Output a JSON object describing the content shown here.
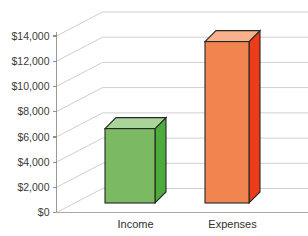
{
  "chart_data": {
    "type": "bar",
    "title": "",
    "xlabel": "",
    "ylabel": "",
    "categories": [
      "Income",
      "Expenses"
    ],
    "values": [
      5900,
      12800
    ],
    "ylim": [
      0,
      14000
    ],
    "ytick_values": [
      0,
      2000,
      4000,
      6000,
      8000,
      10000,
      12000,
      14000
    ],
    "ytick_labels": [
      "$0",
      "$2,000",
      "$4,000",
      "$6,000",
      "$8,000",
      "$10,000",
      "$12,000",
      "$14,000"
    ],
    "grid": true,
    "legend": "none",
    "style": "3d-column",
    "series": [
      {
        "name": "Amount",
        "values": [
          5900,
          12800
        ],
        "point_colors": [
          "#7cb963",
          "#f0854f"
        ]
      }
    ],
    "bar_colors": {
      "income_front": "#7cb963",
      "income_side": "#4cac3b",
      "income_top": "#a9d49a",
      "expenses_front": "#f0854f",
      "expenses_side": "#ee3b1a",
      "expenses_top": "#f8b18b"
    },
    "axis_colors": {
      "gridline": "#c9c9c9",
      "axis": "#9a9a9a",
      "tick_label": "#3a3a3a",
      "category_label": "#2f2f2f",
      "bar_outline": "#262626",
      "background": "#ffffff"
    }
  }
}
